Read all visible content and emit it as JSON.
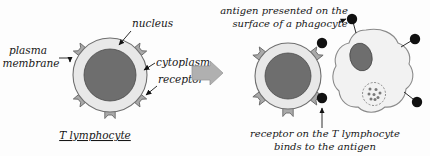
{
  "figure": {
    "background_color": "#fdfdfd",
    "ink_color": "#161616"
  },
  "colors": {
    "cytoplasm": "#e8e8e8",
    "cytoplasm_stroke": "#6f6f6f",
    "nucleus": "#6e6e6e",
    "nucleus_stroke": "#4a4a4a",
    "receptor": "#a9a9a9",
    "receptor_stroke": "#6b6b6b",
    "antigen": "#111111",
    "phagocyte_body": "#f2f2f2",
    "phagocyte_stroke": "#8a8a8a",
    "block_arrow": "#b0b0b0",
    "block_arrow_stroke": "#9a9a9a"
  },
  "left_panel": {
    "caption": "T lymphocyte",
    "labels": {
      "plasma_membrane_line1": "plasma",
      "plasma_membrane_line2": "membrane",
      "nucleus": "nucleus",
      "cytoplasm": "cytoplasm",
      "receptor": "receptor"
    },
    "cell": {
      "name": "T lymphocyte",
      "receptor_count": 5,
      "nucleus_shape": "circle",
      "center_x": 110,
      "center_y": 75,
      "cytoplasm_radius": 37,
      "nucleus_radius": 26
    }
  },
  "transition": {
    "icon": "block-arrow-right",
    "direction": "right"
  },
  "right_panel": {
    "top_caption_line1": "antigen presented on the",
    "top_caption_line2": "surface of a phagocyte",
    "bottom_caption_line1": "receptor on the T lymphocyte",
    "bottom_caption_line2": "binds to the antigen",
    "t_cell": {
      "name": "T lymphocyte",
      "receptor_count": 5,
      "bound_antigen_count": 2,
      "center_x": 288,
      "center_y": 76,
      "cytoplasm_radius": 33,
      "nucleus_radius": 23
    },
    "phagocyte": {
      "name": "phagocyte",
      "nucleus_shape": "oval",
      "vesicle": "phagosome with digested antigen fragments",
      "surface_antigen_count": 4
    }
  }
}
